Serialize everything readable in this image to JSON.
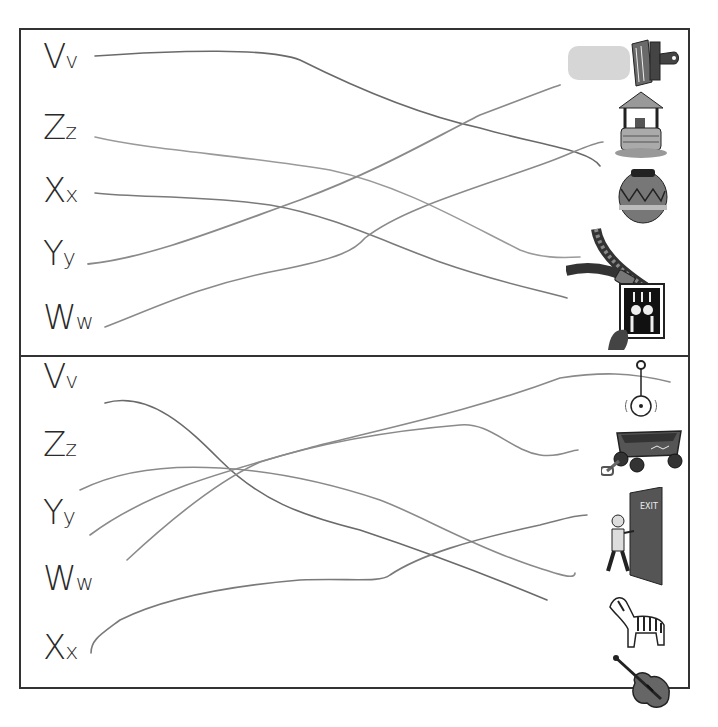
{
  "worksheet": {
    "title": "Letter-to-picture matching",
    "top_panel": {
      "letters": [
        {
          "upper": "V",
          "lower": "v"
        },
        {
          "upper": "Z",
          "lower": "z"
        },
        {
          "upper": "X",
          "lower": "x"
        },
        {
          "upper": "Y",
          "lower": "y"
        },
        {
          "upper": "W",
          "lower": "w"
        }
      ],
      "pictures": [
        "paintbrush",
        "wishing-well",
        "vase",
        "zipper",
        "x-ray"
      ]
    },
    "bottom_panel": {
      "letters": [
        {
          "upper": "V",
          "lower": "v"
        },
        {
          "upper": "Z",
          "lower": "z"
        },
        {
          "upper": "Y",
          "lower": "y"
        },
        {
          "upper": "W",
          "lower": "w"
        },
        {
          "upper": "X",
          "lower": "x"
        }
      ],
      "pictures": [
        "yo-yo",
        "wagon",
        "exit-door",
        "zebra",
        "violin"
      ],
      "door_sign": "EXIT"
    },
    "colors": {
      "border": "#333333",
      "pencil_dark": "#6e6e6e",
      "pencil_light": "#9a9a9a",
      "paint_smear": "#d6d6d6"
    }
  }
}
